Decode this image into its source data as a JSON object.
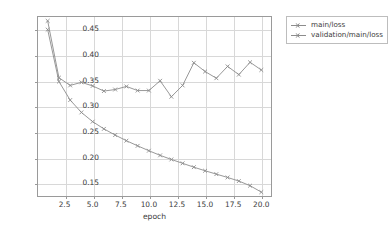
{
  "chart_data": {
    "type": "line",
    "title": "",
    "xlabel": "epoch",
    "ylabel": "",
    "xlim": [
      0.05,
      20.95
    ],
    "ylim": [
      0.1235,
      0.4755
    ],
    "xticks": [
      "2.5",
      "5.0",
      "7.5",
      "10.0",
      "12.5",
      "15.0",
      "17.5",
      "20.0"
    ],
    "xtick_values": [
      2.5,
      5.0,
      7.5,
      10.0,
      12.5,
      15.0,
      17.5,
      20.0
    ],
    "yticks": [
      "0.15",
      "0.20",
      "0.25",
      "0.30",
      "0.35",
      "0.40",
      "0.45"
    ],
    "ytick_values": [
      0.15,
      0.2,
      0.25,
      0.3,
      0.35,
      0.4,
      0.45
    ],
    "grid": true,
    "legend_position": "right-outside",
    "x": [
      1,
      2,
      3,
      4,
      5,
      6,
      7,
      8,
      9,
      10,
      11,
      12,
      13,
      14,
      15,
      16,
      17,
      18,
      19,
      20
    ],
    "series": [
      {
        "name": "main/loss",
        "color": "#8c8c8c",
        "marker": "x",
        "values": [
          0.449,
          0.348,
          0.312,
          0.288,
          0.27,
          0.256,
          0.244,
          0.233,
          0.223,
          0.2135,
          0.2045,
          0.1965,
          0.189,
          0.1815,
          0.1745,
          0.168,
          0.1615,
          0.1545,
          0.1455,
          0.133
        ]
      },
      {
        "name": "validation/main/loss",
        "color": "#8c8c8c",
        "marker": "x",
        "values": [
          0.466,
          0.3555,
          0.3405,
          0.3465,
          0.3395,
          0.3295,
          0.3325,
          0.3385,
          0.3305,
          0.3305,
          0.3495,
          0.3185,
          0.3405,
          0.3845,
          0.3675,
          0.3545,
          0.3775,
          0.3615,
          0.3855,
          0.3705
        ]
      }
    ]
  },
  "legend": {
    "entries": [
      {
        "label": "main/loss"
      },
      {
        "label": "validation/main/loss"
      }
    ]
  }
}
